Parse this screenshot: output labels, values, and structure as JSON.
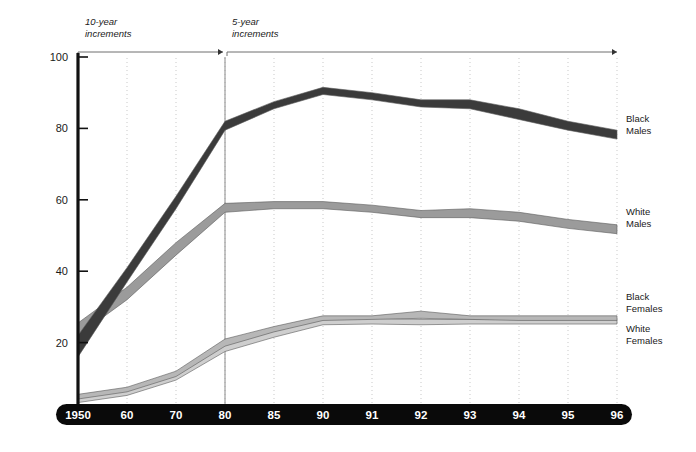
{
  "chart_data": {
    "type": "line",
    "title": "",
    "subtitle": "",
    "xlabel": "",
    "ylabel": "",
    "xlim_labels": [
      "1950",
      "96"
    ],
    "ylim": [
      0,
      100
    ],
    "yticks": [
      0,
      20,
      40,
      60,
      80,
      100
    ],
    "ytick_labels": [
      "0",
      "20",
      "40",
      "60",
      "80",
      "100"
    ],
    "categories": [
      "1950",
      "60",
      "70",
      "80",
      "85",
      "90",
      "91",
      "92",
      "93",
      "94",
      "95",
      "96"
    ],
    "grid": "vertical-dotted",
    "legend_position": "right-inline",
    "annotations": [
      {
        "id": "ann-10yr",
        "text_line1": "10-year",
        "text_line2": "increments",
        "span_from": "1950",
        "span_to": "80"
      },
      {
        "id": "ann-5yr",
        "text_line1": "5-year",
        "text_line2": "increments",
        "span_from": "80",
        "span_to": "96"
      }
    ],
    "series": [
      {
        "name": "Black Males",
        "label_line1": "Black",
        "label_line2": "Males",
        "color": "#3b3b3b",
        "band": true,
        "values_upper": [
          22.0,
          41.0,
          61.0,
          82.0,
          87.5,
          91.5,
          90.0,
          88.0,
          88.0,
          85.5,
          82.0,
          79.5
        ],
        "values_lower": [
          16.0,
          37.0,
          57.5,
          79.5,
          85.5,
          89.5,
          88.0,
          86.0,
          85.5,
          82.5,
          79.5,
          77.0
        ],
        "values": [
          19.0,
          39.0,
          59.2,
          80.8,
          86.5,
          90.5,
          89.0,
          87.0,
          86.8,
          84.0,
          80.8,
          78.2
        ]
      },
      {
        "name": "White Males",
        "label_line1": "White",
        "label_line2": "Males",
        "color": "#9b9b9b",
        "band": true,
        "values_upper": [
          25.5,
          35.5,
          48.0,
          59.0,
          59.5,
          59.5,
          58.5,
          57.0,
          57.5,
          56.5,
          54.5,
          53.0
        ],
        "values_lower": [
          22.0,
          32.0,
          44.5,
          56.5,
          57.5,
          57.5,
          56.5,
          55.0,
          55.0,
          54.0,
          52.0,
          50.5
        ],
        "values": [
          23.8,
          33.8,
          46.2,
          57.8,
          58.5,
          58.5,
          57.5,
          56.0,
          56.2,
          55.2,
          53.2,
          51.8
        ]
      },
      {
        "name": "Black Females",
        "label_line1": "Black",
        "label_line2": "Females",
        "color": "#b7b7b7",
        "band": true,
        "values_upper": [
          5.5,
          7.5,
          12.0,
          21.0,
          24.5,
          27.5,
          27.5,
          28.8,
          27.5,
          27.5,
          27.5,
          27.5
        ],
        "values_lower": [
          4.2,
          6.2,
          10.5,
          19.0,
          23.0,
          26.2,
          26.5,
          26.8,
          26.5,
          26.2,
          26.2,
          26.2
        ],
        "values": [
          4.8,
          6.8,
          11.2,
          20.0,
          23.8,
          26.8,
          27.0,
          27.8,
          27.0,
          26.8,
          26.8,
          26.8
        ]
      },
      {
        "name": "White Females",
        "label_line1": "White",
        "label_line2": "Females",
        "color": "#cecece",
        "band": true,
        "values_upper": [
          4.5,
          6.5,
          11.0,
          19.5,
          23.2,
          26.5,
          26.8,
          26.5,
          26.5,
          26.5,
          26.5,
          26.5
        ],
        "values_lower": [
          3.2,
          5.2,
          9.5,
          17.5,
          21.5,
          25.0,
          25.2,
          25.0,
          25.2,
          25.2,
          25.2,
          25.2
        ],
        "values": [
          3.8,
          5.8,
          10.2,
          18.5,
          22.3,
          25.8,
          26.0,
          25.8,
          25.8,
          25.8,
          25.8,
          25.8
        ]
      }
    ]
  },
  "axes": {
    "y_axis_name": "y-axis",
    "x_axis_name": "x-axis-band"
  },
  "colors": {
    "axis": "#111111",
    "xband": "#0a0a0a",
    "gridline": "#c9c9c9",
    "reference_line": "#8a8a8a",
    "annotation_rule": "#6f6f6f"
  }
}
